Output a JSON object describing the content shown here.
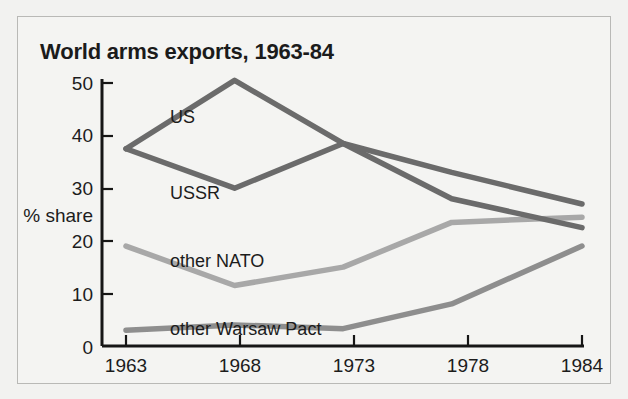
{
  "figure": {
    "title": "World arms exports, 1963-84",
    "background_color": "#f4f4f2",
    "border_color": "#b9b9b6"
  },
  "axes": {
    "y_axis_title": "% share",
    "y_ticks": [
      "0",
      "10",
      "20",
      "30",
      "40",
      "50"
    ],
    "x_ticks": [
      "1963",
      "1968",
      "1973",
      "1978",
      "1984"
    ]
  },
  "series_labels": {
    "us": "US",
    "ussr": "USSR",
    "other_nato": "other NATO",
    "other_warsaw_pact": "other Warsaw Pact"
  },
  "chart_data": {
    "type": "line",
    "title": "World arms exports, 1963-84",
    "xlabel": "",
    "ylabel": "% share",
    "x": [
      1963,
      1968,
      1973,
      1978,
      1984
    ],
    "categories": [
      "1963",
      "1968",
      "1973",
      "1978",
      "1984"
    ],
    "xlim": [
      1963,
      1984
    ],
    "ylim": [
      0,
      52
    ],
    "yticks": [
      0,
      10,
      20,
      30,
      40,
      50
    ],
    "grid": false,
    "legend": "inline-labels",
    "series": [
      {
        "name": "US",
        "color": "#6b6b6b",
        "values": [
          37.5,
          50.5,
          38.5,
          33.0,
          27.0
        ]
      },
      {
        "name": "USSR",
        "color": "#6b6b6b",
        "values": [
          37.5,
          30.0,
          38.5,
          28.0,
          22.5
        ]
      },
      {
        "name": "other NATO",
        "color": "#a8a8a8",
        "values": [
          19.0,
          11.5,
          15.0,
          23.5,
          24.5
        ]
      },
      {
        "name": "other Warsaw Pact",
        "color": "#8e8e8e",
        "values": [
          3.0,
          4.0,
          3.3,
          8.0,
          19.0
        ]
      }
    ]
  }
}
